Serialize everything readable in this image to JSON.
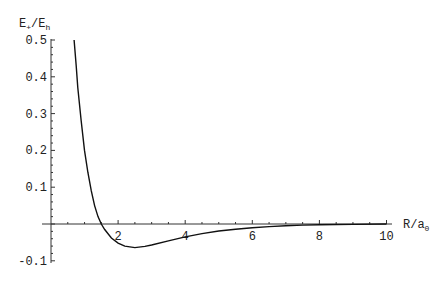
{
  "chart_data": {
    "type": "line",
    "title": "",
    "xlabel": "R/a",
    "xlabel_sub": "0",
    "ylabel": "E",
    "ylabel_sub1": "+",
    "ylabel_mid": "/E",
    "ylabel_sub2": "h",
    "xlim": [
      0,
      10
    ],
    "ylim": [
      -0.1,
      0.5
    ],
    "grid": false,
    "legend": null,
    "x_ticks": [
      {
        "value": 2,
        "label": "2"
      },
      {
        "value": 4,
        "label": "4"
      },
      {
        "value": 6,
        "label": "6"
      },
      {
        "value": 8,
        "label": "8"
      },
      {
        "value": 10,
        "label": "10"
      }
    ],
    "y_ticks": [
      {
        "value": 0.5,
        "label": "0.5"
      },
      {
        "value": 0.4,
        "label": "0.4"
      },
      {
        "value": 0.3,
        "label": "0.3"
      },
      {
        "value": 0.2,
        "label": "0.2"
      },
      {
        "value": 0.1,
        "label": "0.1"
      },
      {
        "value": -0.1,
        "label": "-0.1"
      }
    ],
    "series": [
      {
        "name": "E+",
        "x": [
          0.69,
          0.75,
          0.8,
          0.9,
          1.0,
          1.1,
          1.2,
          1.3,
          1.4,
          1.5,
          1.6,
          1.8,
          2.0,
          2.2,
          2.5,
          2.8,
          3.0,
          3.5,
          4.0,
          4.5,
          5.0,
          5.5,
          6.0,
          6.5,
          7.0,
          7.5,
          8.0,
          9.0,
          10.0
        ],
        "y": [
          0.5,
          0.43,
          0.37,
          0.28,
          0.2,
          0.14,
          0.09,
          0.05,
          0.02,
          0.0,
          -0.015,
          -0.038,
          -0.052,
          -0.06,
          -0.064,
          -0.061,
          -0.057,
          -0.046,
          -0.035,
          -0.026,
          -0.019,
          -0.014,
          -0.01,
          -0.007,
          -0.005,
          -0.003,
          -0.002,
          -0.001,
          0.0
        ]
      }
    ]
  }
}
